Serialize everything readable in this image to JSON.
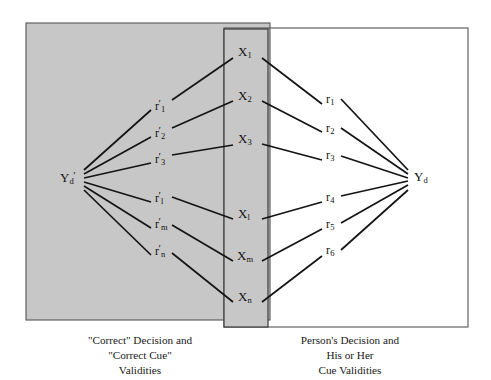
{
  "figure": {
    "type": "lens-model-diagram",
    "title": "",
    "background_color": "#ffffff",
    "panel_fill": "#c7c7c7",
    "line_color": "#1a1a1a"
  },
  "panels": {
    "left": {
      "name": "correct-side-panel",
      "fill": "#c7c7c7",
      "x": 26,
      "y": 23,
      "width": 244,
      "height": 297
    },
    "center": {
      "name": "cue-column-panel",
      "fill": "#c7c7c7",
      "x": 224,
      "y": 29,
      "width": 44,
      "height": 298
    },
    "right": {
      "name": "person-side-panel",
      "fill": "none",
      "x": 224,
      "y": 28,
      "width": 244,
      "height": 299
    }
  },
  "nodes": {
    "criterion_left": {
      "base": "Y",
      "sub": "d",
      "prime": "′",
      "x": 70,
      "y": 177
    },
    "criterion_right": {
      "base": "Y",
      "sub": "d",
      "prime": "",
      "x": 420,
      "y": 177
    },
    "cues": [
      {
        "base": "X",
        "sub": "1",
        "x": 246,
        "y": 52
      },
      {
        "base": "X",
        "sub": "2",
        "x": 246,
        "y": 96
      },
      {
        "base": "X",
        "sub": "3",
        "x": 246,
        "y": 139
      },
      {
        "base": "X",
        "sub": "l",
        "x": 246,
        "y": 214
      },
      {
        "base": "X",
        "sub": "m",
        "x": 246,
        "y": 256
      },
      {
        "base": "X",
        "sub": "n",
        "x": 246,
        "y": 297
      }
    ]
  },
  "edge_labels": {
    "left_validities": [
      {
        "base": "r",
        "prime": "′",
        "sub": "1",
        "x": 159,
        "y": 104
      },
      {
        "base": "r",
        "prime": "′",
        "sub": "2",
        "x": 159,
        "y": 131
      },
      {
        "base": "r",
        "prime": "′",
        "sub": "3",
        "x": 159,
        "y": 157
      },
      {
        "base": "r",
        "prime": "′",
        "sub": "l",
        "x": 159,
        "y": 196
      },
      {
        "base": "r",
        "prime": "′",
        "sub": "m",
        "x": 159,
        "y": 222
      },
      {
        "base": "r",
        "prime": "′",
        "sub": "n",
        "x": 159,
        "y": 249
      }
    ],
    "right_validities": [
      {
        "base": "r",
        "prime": "",
        "sub": "1",
        "x": 329,
        "y": 99
      },
      {
        "base": "r",
        "prime": "",
        "sub": "2",
        "x": 329,
        "y": 128
      },
      {
        "base": "r",
        "prime": "",
        "sub": "3",
        "x": 329,
        "y": 155
      },
      {
        "base": "r",
        "prime": "",
        "sub": "4",
        "x": 329,
        "y": 197
      },
      {
        "base": "r",
        "prime": "",
        "sub": "5",
        "x": 329,
        "y": 224
      },
      {
        "base": "r",
        "prime": "",
        "sub": "6",
        "x": 329,
        "y": 250
      }
    ]
  },
  "captions": {
    "left": "\"Correct\" Decision and\n\"Correct Cue\"\nValidities",
    "right": "Person's Decision and\nHis or Her\nCue Validities"
  },
  "edges": {
    "left_segments": [
      {
        "from": "criterion_left",
        "to": "cue_1"
      },
      {
        "from": "criterion_left",
        "to": "cue_2"
      },
      {
        "from": "criterion_left",
        "to": "cue_3"
      },
      {
        "from": "criterion_left",
        "to": "cue_l"
      },
      {
        "from": "criterion_left",
        "to": "cue_m"
      },
      {
        "from": "criterion_left",
        "to": "cue_n"
      }
    ],
    "right_segments": [
      {
        "from": "cue_1",
        "to": "criterion_right"
      },
      {
        "from": "cue_2",
        "to": "criterion_right"
      },
      {
        "from": "cue_3",
        "to": "criterion_right"
      },
      {
        "from": "cue_l",
        "to": "criterion_right"
      },
      {
        "from": "cue_m",
        "to": "criterion_right"
      },
      {
        "from": "cue_n",
        "to": "criterion_right"
      }
    ]
  }
}
